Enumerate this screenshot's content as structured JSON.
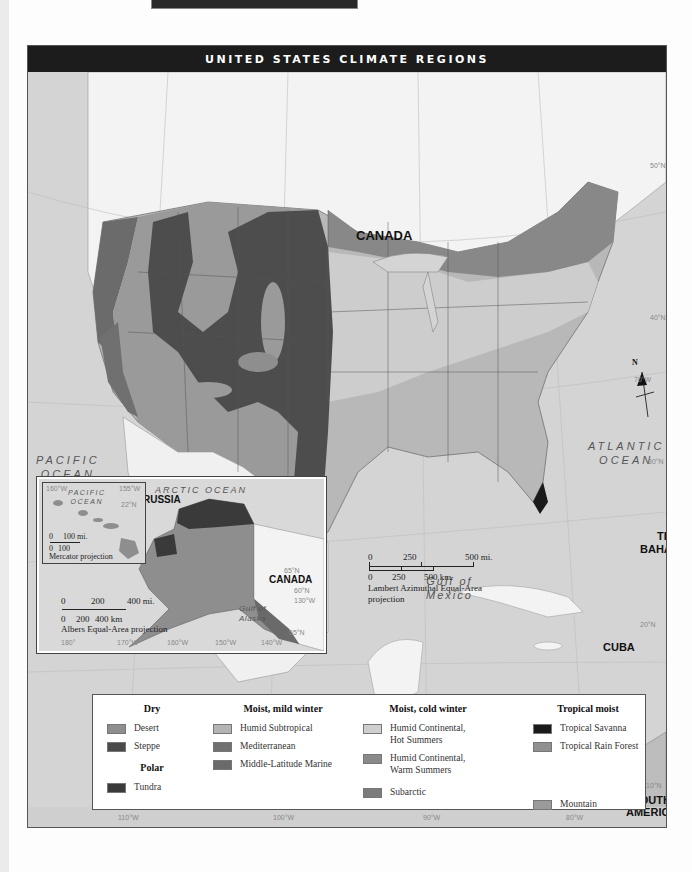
{
  "page": {
    "title": "UNITED STATES CLIMATE REGIONS"
  },
  "labels": {
    "canada": "CANADA",
    "mexico": "MEXICO",
    "bahamas_1": "THE",
    "bahamas_2": "BAHAMAS",
    "cuba": "CUBA",
    "south_america_1": "SOUTH",
    "south_america_2": "AMERICA",
    "russia": "RUSSIA",
    "alaska_canada": "CANADA"
  },
  "oceans": {
    "pacific_1": "PACIFIC",
    "pacific_2": "OCEAN",
    "atlantic_1": "ATLANTIC",
    "atlantic_2": "OCEAN",
    "gulf_1": "Gulf of",
    "gulf_2": "Mexico",
    "arctic": "ARCTIC OCEAN",
    "hawaii_pacific_1": "PACIFIC",
    "hawaii_pacific_2": "OCEAN",
    "gulf_alaska_1": "Gulf of",
    "gulf_alaska_2": "Alaska"
  },
  "graticule": {
    "lat_50": "50°N",
    "lat_40": "40°N",
    "lat_30": "30°N",
    "lat_20": "20°N",
    "lat_10": "10°N",
    "lon_70": "70°W",
    "lon_120": "120°W",
    "bottom_110": "110°W",
    "bottom_100": "100°W",
    "bottom_90": "90°W",
    "bottom_80": "80°W",
    "hawaii_160": "160°W",
    "hawaii_155": "155°W",
    "hawaii_22": "22°N",
    "alaska_180": "180°",
    "alaska_170": "170°W",
    "alaska_160": "160°W",
    "alaska_150": "150°W",
    "alaska_140": "140°W",
    "alaska_130": "130°W",
    "alaska_65": "65°N",
    "alaska_60": "60°N",
    "alaska_55": "55°N"
  },
  "compass": {
    "north": "N"
  },
  "main_scale": {
    "mi_0": "0",
    "mi_250": "250",
    "mi_500": "500 mi.",
    "km_0": "0",
    "km_250": "250",
    "km_500": "500 km",
    "projection_1": "Lambert Azimuthal Equal-Area",
    "projection_2": "projection"
  },
  "hawaii_scale": {
    "mi_0": "0",
    "mi_100": "100 mi.",
    "km_0": "0",
    "km_100": "100",
    "projection": "Mercator projection"
  },
  "alaska_scale": {
    "mi_0": "0",
    "mi_200": "200",
    "mi_400": "400 mi.",
    "km_0": "0",
    "km_200": "200",
    "km_400": "400 km",
    "projection": "Albers Equal-Area projection"
  },
  "legend": {
    "groups": [
      {
        "heading": "Dry",
        "items": [
          {
            "label": "Desert",
            "color": "#8e8e8e"
          },
          {
            "label": "Steppe",
            "color": "#4a4a4a"
          }
        ]
      },
      {
        "heading": "Polar",
        "items": [
          {
            "label": "Tundra",
            "color": "#3a3a3a"
          }
        ]
      },
      {
        "heading": "Moist, mild winter",
        "items": [
          {
            "label": "Humid Subtropical",
            "color": "#b4b4b4"
          },
          {
            "label": "Mediterranean",
            "color": "#707070"
          },
          {
            "label": "Middle-Latitude Marine",
            "color": "#6a6a6a"
          }
        ]
      },
      {
        "heading": "Moist, cold winter",
        "items": [
          {
            "label": "Humid Continental, Hot Summers",
            "label_1": "Humid Continental,",
            "label_2": "Hot Summers",
            "color": "#cfcfcf"
          },
          {
            "label": "Humid Continental, Warm Summers",
            "label_1": "Humid Continental,",
            "label_2": "Warm Summers",
            "color": "#8a8a8a"
          },
          {
            "label": "Subarctic",
            "color": "#7c7c7c"
          }
        ]
      },
      {
        "heading": "Tropical moist",
        "items": [
          {
            "label": "Tropical Savanna",
            "color": "#1a1a1a"
          },
          {
            "label": "Tropical Rain Forest",
            "color": "#909090"
          },
          {
            "label": "Mountain",
            "color": "#9a9a9a"
          }
        ]
      }
    ]
  }
}
